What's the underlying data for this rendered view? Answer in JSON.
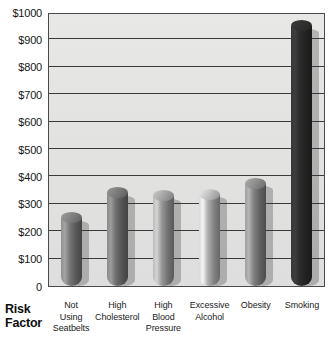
{
  "chart_data": {
    "type": "bar",
    "title": "",
    "subtitle": "",
    "xlabel": "Risk Factor",
    "ylabel": "",
    "categories": [
      "Not Using Seatbelts",
      "High Cholesterol",
      "High Blood Pressure",
      "Excessive Alcohol",
      "Obesity",
      "Smoking"
    ],
    "category_lines": [
      [
        "Not",
        "Using",
        "Seatbelts"
      ],
      [
        "High",
        "Cholesterol"
      ],
      [
        "High",
        "Blood",
        "Pressure"
      ],
      [
        "Excessive",
        "Alcohol"
      ],
      [
        "Obesity"
      ],
      [
        "Smoking"
      ]
    ],
    "values": [
      250,
      340,
      330,
      335,
      375,
      950
    ],
    "ylim": [
      0,
      1000
    ],
    "ytick_values": [
      0,
      100,
      200,
      300,
      400,
      500,
      600,
      700,
      800,
      900,
      1000
    ],
    "ytick_labels": [
      "0",
      "$100",
      "$200",
      "$300",
      "$400",
      "$500",
      "$600",
      "$700",
      "$800",
      "$900",
      "$1000"
    ],
    "grid": true,
    "legend": false,
    "legend_position": "none",
    "bar_colors": [
      "#6f6f6f",
      "#6a6a6a",
      "#8f8f8f",
      "#a6a6a6",
      "#7a7a7a",
      "#2a2a2a"
    ],
    "plot_background": "#e3e3e1"
  },
  "axis": {
    "x_title_line1": "Risk",
    "x_title_line2": "Factor"
  }
}
